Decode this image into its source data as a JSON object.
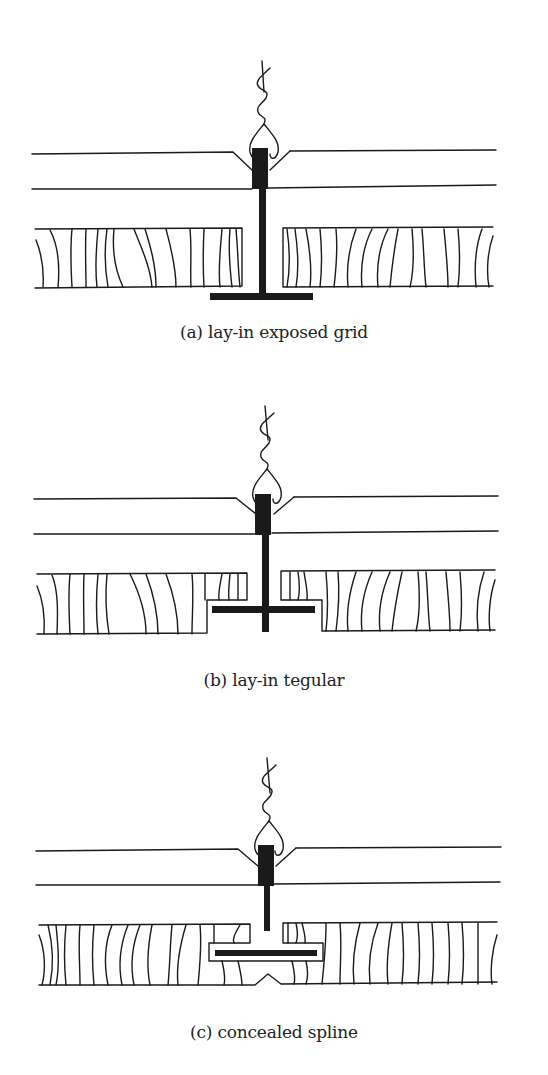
{
  "figures": [
    {
      "id": "a",
      "caption": "(a) lay-in exposed grid",
      "type": "exposed-grid"
    },
    {
      "id": "b",
      "caption": "(b) lay-in tegular",
      "type": "tegular"
    },
    {
      "id": "c",
      "caption": "(c) concealed spline",
      "type": "concealed-spline"
    }
  ],
  "colors": {
    "line": "#1a1a1a",
    "background": "#ffffff"
  }
}
